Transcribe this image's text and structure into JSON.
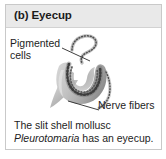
{
  "panel": {
    "title": "(b) Eyecup",
    "header_bg": "#e9e9e9",
    "border_color": "#c9c9c9",
    "background": "#ffffff"
  },
  "labels": {
    "pigmented_cells": {
      "line_1": "Pigmented",
      "line_2": "cells"
    },
    "nerve_fibers": {
      "text": "Nerve fibers"
    }
  },
  "caption": {
    "line_1": "The slit shell mollusc",
    "genus": "Pleurotomaria",
    "line_2_rest": " has an eyecup."
  },
  "illustration": {
    "name": "eyecup-diagram",
    "description": "Grayscale cup-shaped eyecup with dotted pigmented cell layer and tapering nerve stalk",
    "tissue_fill": "#c6c6c6",
    "tissue_shadow": "#9b9b9b",
    "pigment_color": "#4a4a4a",
    "leader_line_color": "#2a2a2a"
  }
}
